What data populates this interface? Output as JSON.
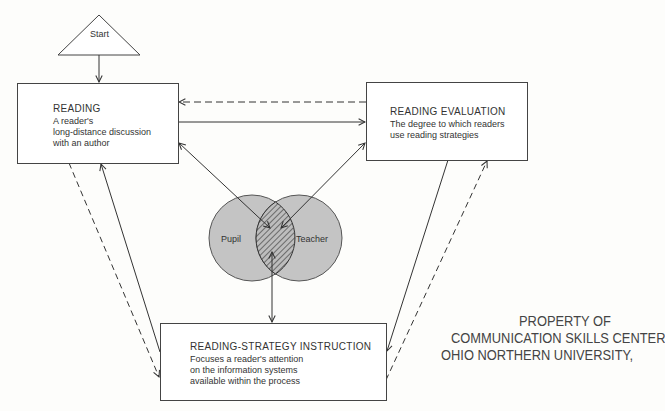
{
  "start": {
    "label": "Start"
  },
  "nodes": {
    "reading": {
      "title": "READING",
      "description": "A reader's\nlong-distance discussion\nwith an author"
    },
    "evaluation": {
      "title": "READING EVALUATION",
      "description": "The degree to which readers\nuse reading strategies"
    },
    "instruction": {
      "title": "READING-STRATEGY INSTRUCTION",
      "description": "Focuses a reader's attention\non the information systems\navailable within the process"
    }
  },
  "venn": {
    "left": "Pupil",
    "right": "Teacher",
    "fill_color": "#c4c4c4",
    "overlap_style": "hatched"
  },
  "stamp": {
    "line1": "PROPERTY OF",
    "line2": "COMMUNICATION SKILLS CENTER",
    "line3": "OHIO NORTHERN UNIVERSITY,"
  },
  "connections": [
    {
      "from": "start",
      "to": "reading",
      "style": "solid"
    },
    {
      "from": "reading",
      "to": "evaluation",
      "style": "solid"
    },
    {
      "from": "evaluation",
      "to": "reading",
      "style": "dashed"
    },
    {
      "from": "reading",
      "to": "instruction",
      "style": "dashed"
    },
    {
      "from": "instruction",
      "to": "reading",
      "style": "solid"
    },
    {
      "from": "evaluation",
      "to": "instruction",
      "style": "solid"
    },
    {
      "from": "instruction",
      "to": "evaluation",
      "style": "dashed"
    },
    {
      "from": "overlap",
      "to": "reading",
      "style": "solid",
      "bidirectional": true
    },
    {
      "from": "overlap",
      "to": "evaluation",
      "style": "solid",
      "bidirectional": true
    },
    {
      "from": "overlap",
      "to": "instruction",
      "style": "solid",
      "bidirectional": true
    }
  ]
}
